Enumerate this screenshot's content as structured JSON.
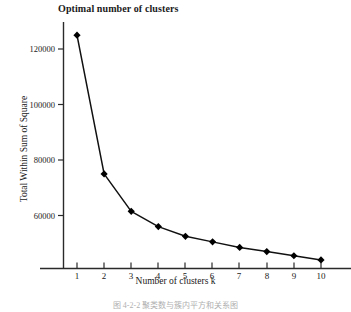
{
  "chart_data": {
    "type": "line",
    "title": "Optimal number of clusters",
    "xlabel": "Number of clusters k",
    "ylabel": "Total Within Sum of Square",
    "categories": [
      1,
      2,
      3,
      4,
      5,
      6,
      7,
      8,
      9,
      10
    ],
    "x": [
      1,
      2,
      3,
      4,
      5,
      6,
      7,
      8,
      9,
      10
    ],
    "values": [
      125000,
      75000,
      61500,
      56000,
      52500,
      50500,
      48500,
      47000,
      45500,
      44000
    ],
    "series": [
      {
        "name": "Total Within Sum of Square",
        "values": [
          125000,
          75000,
          61500,
          56000,
          52500,
          50500,
          48500,
          47000,
          45500,
          44000
        ]
      }
    ],
    "xlim": [
      0.55,
      10.45
    ],
    "ylim": [
      42000,
      128000
    ],
    "xticks": [
      1,
      2,
      3,
      4,
      5,
      6,
      7,
      8,
      9,
      10
    ],
    "xtick_labels": [
      "1",
      "2",
      "3",
      "4",
      "5",
      "6",
      "7",
      "8",
      "9",
      "10"
    ],
    "yticks": [
      60000,
      80000,
      100000,
      120000
    ],
    "ytick_labels": [
      "60000",
      "80000",
      "100000",
      "120000"
    ],
    "grid": false,
    "legend": false,
    "legend_position": "none",
    "marker": "diamond",
    "line_color": "#111111",
    "marker_color": "#000000",
    "axis_color": "#2a2a2a",
    "background": "#ffffff"
  },
  "caption": {
    "text": "图 4-2-2  聚类数与簇内平方和关系图"
  }
}
